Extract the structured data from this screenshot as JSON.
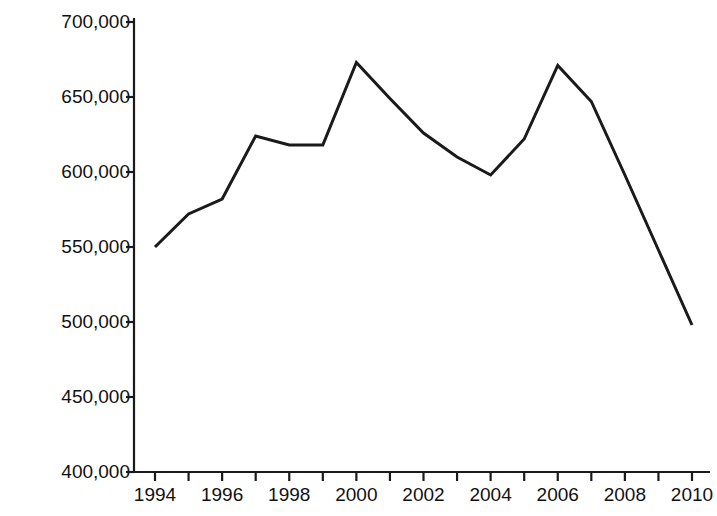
{
  "chart_data": {
    "type": "line",
    "title": "",
    "xlabel": "",
    "ylabel": "Number of Businesses",
    "x": [
      1994,
      1995,
      1996,
      1997,
      1998,
      1999,
      2000,
      2001,
      2002,
      2003,
      2004,
      2005,
      2006,
      2007,
      2008,
      2009,
      2010
    ],
    "values": [
      550000,
      572000,
      582000,
      624000,
      618000,
      618000,
      673000,
      649000,
      626000,
      610000,
      598000,
      622000,
      671000,
      647000,
      598000,
      548000,
      498000
    ],
    "series": [
      {
        "name": "Number of Businesses",
        "values": [
          550000,
          572000,
          582000,
          624000,
          618000,
          618000,
          673000,
          649000,
          626000,
          610000,
          598000,
          622000,
          671000,
          647000,
          598000,
          548000,
          498000
        ]
      }
    ],
    "xlim": [
      1993.4,
      2010.5
    ],
    "ylim": [
      400000,
      700000
    ],
    "ytick_values": [
      400000,
      450000,
      500000,
      550000,
      600000,
      650000,
      700000
    ],
    "ytick_labels": [
      "400,000",
      "450,000",
      "500,000",
      "550,000",
      "600,000",
      "650,000",
      "700,000"
    ],
    "xtick_values": [
      1994,
      1995,
      1996,
      1997,
      1998,
      1999,
      2000,
      2001,
      2002,
      2003,
      2004,
      2005,
      2006,
      2007,
      2008,
      2009,
      2010
    ],
    "xtick_labels": [
      "1994",
      "",
      "1996",
      "",
      "1998",
      "",
      "2000",
      "",
      "2002",
      "",
      "2004",
      "",
      "2006",
      "",
      "2008",
      "",
      "2010"
    ],
    "grid": false,
    "legend": false,
    "legend_position": "none",
    "line_color": "#1a1a1a",
    "line_width": 3,
    "markers": "none",
    "spines": [
      "left",
      "bottom"
    ],
    "tick_direction": "out"
  },
  "axes": {
    "y_title": "Number of Businesses"
  }
}
